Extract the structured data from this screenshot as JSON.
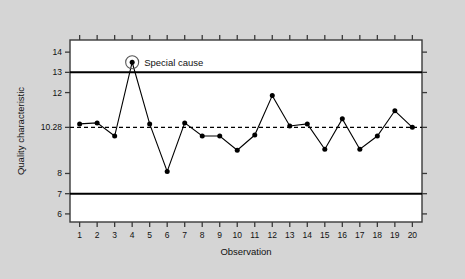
{
  "chart_data": {
    "type": "line",
    "title": "",
    "xlabel": "Observation",
    "ylabel": "Quality characteristic",
    "x": [
      1,
      2,
      3,
      4,
      5,
      6,
      7,
      8,
      9,
      10,
      11,
      12,
      13,
      14,
      15,
      16,
      17,
      18,
      19,
      20
    ],
    "xtick_labels": [
      "1",
      "2",
      "3",
      "4",
      "5",
      "6",
      "7",
      "8",
      "9",
      "10",
      "11",
      "12",
      "13",
      "14",
      "15",
      "16",
      "17",
      "18",
      "19",
      "20"
    ],
    "ytick_labels": [
      "14",
      "13",
      "12",
      "10.28",
      "8",
      "7",
      "6"
    ],
    "ytick_values": [
      14,
      13,
      12,
      10.28,
      8,
      7,
      6
    ],
    "ylim": [
      5.6,
      14.6
    ],
    "xlim": [
      0.45,
      20.55
    ],
    "grid": false,
    "legend": "none",
    "series": [
      {
        "name": "Quality characteristic",
        "values": [
          10.45,
          10.5,
          9.85,
          13.5,
          10.45,
          8.1,
          10.5,
          9.85,
          9.85,
          9.15,
          9.9,
          11.85,
          10.35,
          10.45,
          9.2,
          10.7,
          9.2,
          9.85,
          11.1,
          10.28
        ]
      }
    ],
    "reference_lines": [
      {
        "name": "upper-control-limit",
        "value": 13,
        "style": "solid"
      },
      {
        "name": "center-line",
        "value": 10.28,
        "style": "dashed"
      },
      {
        "name": "lower-control-limit",
        "value": 7,
        "style": "solid"
      }
    ],
    "annotations": [
      {
        "name": "special-cause",
        "text": "Special cause",
        "x": 4,
        "y": 13.5,
        "marker": "circled"
      }
    ],
    "colors": {
      "background": "#d5d5d5",
      "plot_area": "#ffffff",
      "line": "#000000",
      "marker": "#000000",
      "frame": "#333333",
      "limit_line": "#000000"
    }
  }
}
